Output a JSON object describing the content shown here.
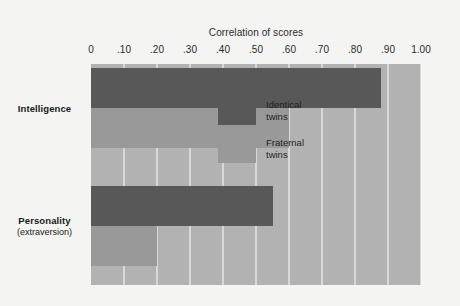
{
  "chart_data": {
    "type": "bar",
    "orientation": "horizontal",
    "title": "Correlation of scores",
    "xlabel": "Correlation of scores",
    "ylabel": "",
    "xlim": [
      0,
      1.0
    ],
    "grid": true,
    "legend_position": "inside-right-middle",
    "categories": [
      "Intelligence",
      "Personality (extraversion)"
    ],
    "category_labels": [
      {
        "name": "Intelligence",
        "sub": ""
      },
      {
        "name": "Personality",
        "sub": "(extraversion)"
      }
    ],
    "tick_labels": [
      "0",
      ".10",
      ".20",
      ".30",
      ".40",
      ".50",
      ".60",
      ".70",
      ".80",
      ".90",
      "1.00"
    ],
    "tick_values": [
      0,
      0.1,
      0.2,
      0.3,
      0.4,
      0.5,
      0.6,
      0.7,
      0.8,
      0.9,
      1.0
    ],
    "series": [
      {
        "name": "Identical twins",
        "color": "#585858",
        "values": [
          0.88,
          0.55
        ]
      },
      {
        "name": "Fraternal twins",
        "color": "#999999",
        "values": [
          0.6,
          0.2
        ]
      }
    ],
    "legend": [
      {
        "label": "Identical",
        "label2": "twins",
        "color": "#585858"
      },
      {
        "label": "Fraternal",
        "label2": "twins",
        "color": "#999999"
      }
    ]
  },
  "colors": {
    "page_background": "#f4f4f3",
    "plot_background": "#b2b2b2",
    "gridline": "#d8d8d6",
    "identical": "#585858",
    "fraternal": "#999999",
    "text": "#1f1f1f"
  }
}
